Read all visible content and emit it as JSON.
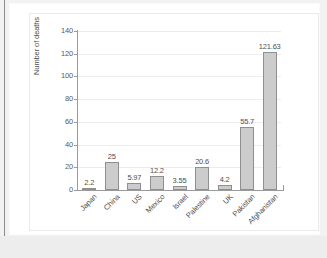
{
  "chart_data": {
    "type": "bar",
    "title": "",
    "xlabel": "",
    "ylabel": "Number of deaths",
    "categories": [
      "Japan",
      "China",
      "US",
      "Mexico",
      "Israel",
      "Palestine",
      "UK",
      "Pakistan",
      "Afghanistan"
    ],
    "values": [
      2.2,
      25,
      5.97,
      12.2,
      3.55,
      20.6,
      4.2,
      55.7,
      121.63
    ],
    "value_labels": [
      "2.2",
      "25",
      "5.97",
      "12.2",
      "3.55",
      "20.6",
      "4.2",
      "55.7",
      "121.63"
    ],
    "ylim": [
      0,
      140
    ],
    "ytick_labels": [
      "0",
      "20",
      "40",
      "60",
      "80",
      "100",
      "120",
      "140"
    ],
    "ytick_values": [
      0,
      20,
      40,
      60,
      80,
      100,
      120,
      140
    ],
    "grid": true,
    "legend": false,
    "legend_position": "none",
    "bar_color": "#cccccc",
    "bar_edge_color": "#8f8f8f",
    "gridline_color": "#ededed",
    "axis_color": "#9a9a9a",
    "text_color": "#4f4f4f",
    "xtick_rotation": -45
  }
}
